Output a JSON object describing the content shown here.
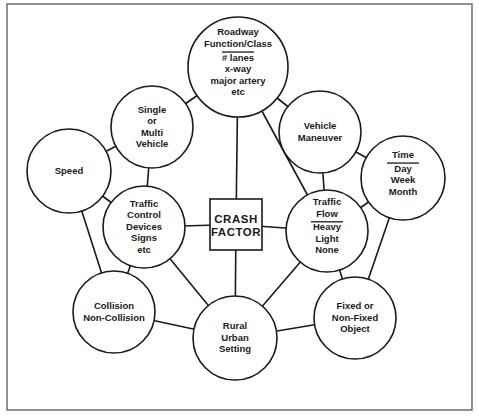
{
  "diagram": {
    "type": "hub-and-spoke concept diagram",
    "frame": {
      "x": 7,
      "y": 4,
      "width": 465,
      "height": 406
    },
    "center": {
      "id": "crash-factor",
      "lines": [
        "CRASH",
        "FACTOR"
      ],
      "x": 210,
      "y": 199,
      "width": 52,
      "height": 51
    },
    "nodes": [
      {
        "id": "roadway",
        "cx": 238,
        "cy": 67,
        "r": 50,
        "title": [
          "Roadway",
          "Function/Class"
        ],
        "details": [
          "# lanes",
          "x-way",
          "major artery",
          "etc"
        ]
      },
      {
        "id": "single-multi-vehicle",
        "cx": 152,
        "cy": 127,
        "r": 41,
        "title": [
          "Single",
          "or",
          "Multi",
          "Vehicle"
        ],
        "details": []
      },
      {
        "id": "vehicle-maneuver",
        "cx": 320,
        "cy": 132,
        "r": 41,
        "title": [
          "Vehicle",
          "Maneuver"
        ],
        "details": []
      },
      {
        "id": "time",
        "cx": 403,
        "cy": 178,
        "r": 42,
        "title": [
          "Time"
        ],
        "details": [
          "Day",
          "Week",
          "Month"
        ]
      },
      {
        "id": "speed",
        "cx": 69,
        "cy": 171,
        "r": 42,
        "title": [
          "Speed"
        ],
        "details": []
      },
      {
        "id": "traffic-control-devices",
        "cx": 144,
        "cy": 227,
        "r": 41,
        "title": [
          "Traffic",
          "Control",
          "Devices",
          "Signs",
          "etc"
        ],
        "details": []
      },
      {
        "id": "traffic-flow",
        "cx": 327,
        "cy": 231,
        "r": 41,
        "title": [
          "Traffic",
          "Flow"
        ],
        "details": [
          "Heavy",
          "Light",
          "None"
        ]
      },
      {
        "id": "collision",
        "cx": 114,
        "cy": 312,
        "r": 41,
        "title": [
          "Collision",
          "Non-Collision"
        ],
        "details": []
      },
      {
        "id": "rural-urban-setting",
        "cx": 235,
        "cy": 338,
        "r": 42,
        "title": [
          "Rural",
          "Urban",
          "Setting"
        ],
        "details": []
      },
      {
        "id": "fixed-object",
        "cx": 355,
        "cy": 318,
        "r": 41,
        "title": [
          "Fixed or",
          "Non-Fixed",
          "Object"
        ],
        "details": []
      }
    ],
    "edges": [
      [
        "roadway",
        "crash-factor"
      ],
      [
        "roadway",
        "traffic-flow"
      ],
      [
        "roadway",
        "single-multi-vehicle"
      ],
      [
        "roadway",
        "vehicle-maneuver"
      ],
      [
        "single-multi-vehicle",
        "speed"
      ],
      [
        "single-multi-vehicle",
        "traffic-control-devices"
      ],
      [
        "vehicle-maneuver",
        "time"
      ],
      [
        "vehicle-maneuver",
        "traffic-flow"
      ],
      [
        "speed",
        "traffic-control-devices"
      ],
      [
        "speed",
        "collision"
      ],
      [
        "time",
        "traffic-flow"
      ],
      [
        "time",
        "fixed-object"
      ],
      [
        "traffic-control-devices",
        "crash-factor"
      ],
      [
        "traffic-control-devices",
        "collision"
      ],
      [
        "traffic-control-devices",
        "rural-urban-setting"
      ],
      [
        "traffic-flow",
        "crash-factor"
      ],
      [
        "traffic-flow",
        "rural-urban-setting"
      ],
      [
        "traffic-flow",
        "fixed-object"
      ],
      [
        "crash-factor",
        "rural-urban-setting"
      ],
      [
        "collision",
        "rural-urban-setting"
      ],
      [
        "rural-urban-setting",
        "fixed-object"
      ]
    ],
    "colors": {
      "stroke": "#1a1a1a",
      "fill": "#ffffff",
      "frame": "#6e6e6e"
    }
  }
}
